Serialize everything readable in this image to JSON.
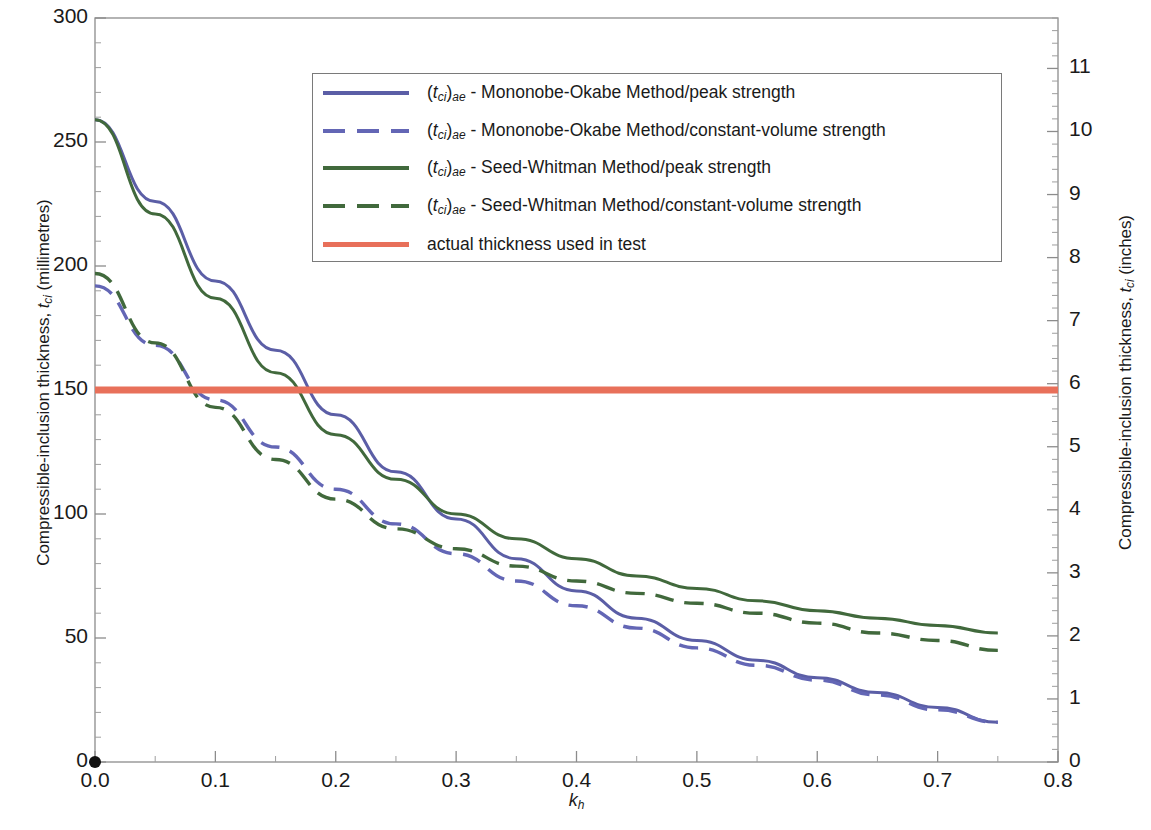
{
  "chart_data": {
    "type": "line",
    "title": "",
    "xlabel": "k_h",
    "ylabel": "Compressible-inclusion thickness, t_ci (millimetres)",
    "ylabel_right": "Compressible-inclusion thickness, t_ci (inches)",
    "xlim": [
      0.0,
      0.8
    ],
    "ylim": [
      0,
      300
    ],
    "ylim_right": [
      0,
      11.8
    ],
    "grid": false,
    "legend_position": "upper-center",
    "xticks": [
      "0.0",
      "0.1",
      "0.2",
      "0.3",
      "0.4",
      "0.5",
      "0.6",
      "0.7",
      "0.8"
    ],
    "xtick_values": [
      0.0,
      0.1,
      0.2,
      0.3,
      0.4,
      0.5,
      0.6,
      0.7,
      0.8
    ],
    "yticks_left": [
      "0",
      "50",
      "100",
      "150",
      "200",
      "250",
      "300"
    ],
    "ytick_values_left": [
      0,
      50,
      100,
      150,
      200,
      250,
      300
    ],
    "yticks_right": [
      "0",
      "1",
      "2",
      "3",
      "4",
      "5",
      "6",
      "7",
      "8",
      "9",
      "10",
      "11"
    ],
    "ytick_values_right": [
      0,
      1,
      2,
      3,
      4,
      5,
      6,
      7,
      8,
      9,
      10,
      11
    ],
    "x": [
      0.0,
      0.05,
      0.1,
      0.15,
      0.2,
      0.25,
      0.3,
      0.35,
      0.4,
      0.45,
      0.5,
      0.55,
      0.6,
      0.65,
      0.7,
      0.75
    ],
    "series": [
      {
        "name": "mononobe-okabe-peak",
        "label": "(t_ci)_ae - Mononobe-Okabe Method/peak strength",
        "color": "#5b5ea6",
        "style": "solid",
        "values": [
          259,
          226,
          194,
          166,
          140,
          117,
          98,
          82,
          69,
          58,
          49,
          41,
          34,
          28,
          22,
          16
        ]
      },
      {
        "name": "mononobe-okabe-constant-volume",
        "label": "(t_ci)_ae - Mononobe-Okabe Method/constant-volume strength",
        "color": "#6366b5",
        "style": "dashed",
        "values": [
          192,
          168,
          146,
          127,
          110,
          96,
          84,
          73,
          63,
          54,
          46,
          39,
          33,
          27,
          21,
          16
        ]
      },
      {
        "name": "seed-whitman-peak",
        "label": "(t_ci)_ae - Seed-Whitman Method/peak strength",
        "color": "#41693c",
        "style": "solid",
        "values": [
          259,
          221,
          187,
          157,
          132,
          114,
          100,
          90,
          82,
          75,
          70,
          65,
          61,
          58,
          55,
          52
        ]
      },
      {
        "name": "seed-whitman-constant-volume",
        "label": "(t_ci)_ae - Seed-Whitman Method/constant-volume strength",
        "color": "#41693c",
        "style": "dashed",
        "values": [
          197,
          169,
          143,
          122,
          106,
          94,
          86,
          79,
          73,
          68,
          64,
          60,
          56,
          52,
          49,
          45
        ]
      },
      {
        "name": "actual-thickness-used-in-test",
        "label": "actual thickness used in test",
        "color": "#e8705a",
        "style": "solid-thick",
        "constant_value": 150,
        "values": [
          150,
          150,
          150,
          150,
          150,
          150,
          150,
          150,
          150,
          150,
          150,
          150,
          150,
          150,
          150,
          150
        ]
      }
    ],
    "origin_marker": {
      "x": 0.0,
      "y": 0,
      "color": "#111111"
    }
  },
  "axes": {
    "left_title_pre": "Compressible-inclusion thickness, ",
    "left_title_var": "t",
    "left_title_sub": "ci",
    "left_title_post": " (millimetres)",
    "right_title_pre": "Compressible-inclusion thickness, ",
    "right_title_var": "t",
    "right_title_sub": "ci",
    "right_title_post": " (inches)",
    "x_title_var": "k",
    "x_title_sub": "h"
  },
  "legend": {
    "items": [
      {
        "prefix_var": "t",
        "prefix_sub1": "ci",
        "prefix_sub2": "ae",
        "text": " - Mononobe-Okabe Method/peak strength",
        "color": "#5b5ea6",
        "style": "solid"
      },
      {
        "prefix_var": "t",
        "prefix_sub1": "ci",
        "prefix_sub2": "ae",
        "text": " - Mononobe-Okabe Method/constant-volume strength",
        "color": "#6366b5",
        "style": "dashed"
      },
      {
        "prefix_var": "t",
        "prefix_sub1": "ci",
        "prefix_sub2": "ae",
        "text": " - Seed-Whitman Method/peak strength",
        "color": "#41693c",
        "style": "solid"
      },
      {
        "prefix_var": "t",
        "prefix_sub1": "ci",
        "prefix_sub2": "ae",
        "text": " - Seed-Whitman Method/constant-volume strength",
        "color": "#41693c",
        "style": "dashed"
      },
      {
        "prefix_var": "",
        "prefix_sub1": "",
        "prefix_sub2": "",
        "text": "actual thickness used in test",
        "color": "#e8705a",
        "style": "solid-thick"
      }
    ]
  }
}
